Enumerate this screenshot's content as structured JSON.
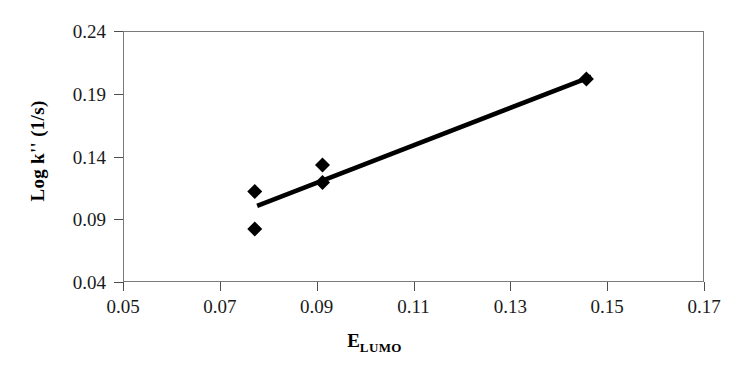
{
  "chart_data": {
    "type": "scatter",
    "title": "",
    "xlabel": "E",
    "xlabel_subscript": "LUMO",
    "xlabel_full": "E_LUMO",
    "ylabel": "Log k'' (1/s)",
    "xlim": [
      0.05,
      0.17
    ],
    "ylim": [
      0.04,
      0.24
    ],
    "xticks": [
      "0.05",
      "0.07",
      "0.09",
      "0.11",
      "0.13",
      "0.15",
      "0.17"
    ],
    "xtick_values": [
      0.05,
      0.07,
      0.09,
      0.11,
      0.13,
      0.15,
      0.17
    ],
    "yticks": [
      "0.04",
      "0.09",
      "0.14",
      "0.19",
      "0.24"
    ],
    "ytick_values": [
      0.04,
      0.09,
      0.14,
      0.19,
      0.24
    ],
    "grid": false,
    "legend": false,
    "marker": "diamond",
    "marker_color": "#000000",
    "line_color": "#000000",
    "points": [
      {
        "x": 0.077,
        "y": 0.113
      },
      {
        "x": 0.077,
        "y": 0.083
      },
      {
        "x": 0.091,
        "y": 0.134
      },
      {
        "x": 0.091,
        "y": 0.12
      },
      {
        "x": 0.1455,
        "y": 0.2025
      }
    ],
    "trendline": {
      "x_start": 0.0775,
      "y_start": 0.1015,
      "x_end": 0.1465,
      "y_end": 0.2045
    }
  },
  "axes": {
    "y_title": "Log k'' (1/s)",
    "x_title_base": "E",
    "x_title_sub": "LUMO"
  }
}
